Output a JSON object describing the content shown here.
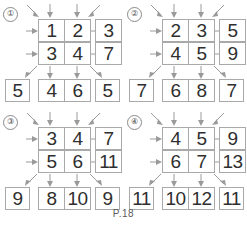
{
  "page": {
    "caption": "P.18",
    "worksheet_type": "addition-grid-puzzle",
    "colors": {
      "background": "#ffffff",
      "box_border": "#a9a9a9",
      "arrow": "#9a9a9a",
      "digit": "#2f2f2f",
      "caption": "#5a5a5a"
    }
  },
  "puzzles": [
    {
      "id": "1",
      "label": "①",
      "grid": [
        [
          "1",
          "2"
        ],
        [
          "3",
          "4"
        ]
      ],
      "right": [
        "3",
        "7"
      ],
      "bottom": [
        "4",
        "6"
      ],
      "corner_bottom_left": "5",
      "corner_bottom_right": "5"
    },
    {
      "id": "2",
      "label": "②",
      "grid": [
        [
          "2",
          "3"
        ],
        [
          "4",
          "5"
        ]
      ],
      "right": [
        "5",
        "9"
      ],
      "bottom": [
        "6",
        "8"
      ],
      "corner_bottom_left": "7",
      "corner_bottom_right": "7"
    },
    {
      "id": "3",
      "label": "③",
      "grid": [
        [
          "3",
          "4"
        ],
        [
          "5",
          "6"
        ]
      ],
      "right": [
        "7",
        "11"
      ],
      "bottom": [
        "8",
        "10"
      ],
      "corner_bottom_left": "9",
      "corner_bottom_right": "9"
    },
    {
      "id": "4",
      "label": "④",
      "grid": [
        [
          "4",
          "5"
        ],
        [
          "6",
          "7"
        ]
      ],
      "right": [
        "9",
        "13"
      ],
      "bottom": [
        "10",
        "12"
      ],
      "corner_bottom_left": "11",
      "corner_bottom_right": "11"
    }
  ]
}
